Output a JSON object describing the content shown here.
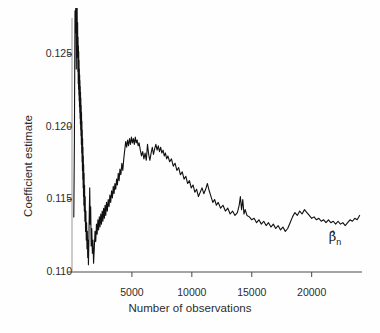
{
  "figure": {
    "background_color": "#fefefe",
    "line_color": "#111111",
    "axis_color": "#4a4a4a"
  },
  "annotations": [
    {
      "name": "beta-hat-n",
      "base": "β̂",
      "sub": "n",
      "x_value": 22000,
      "y_value": 0.1124
    }
  ],
  "chart_data": {
    "type": "line",
    "title": "",
    "xlabel": "Number of observations",
    "ylabel": "Coefficient estimate",
    "xlim": [
      0,
      24200
    ],
    "ylim": [
      0.11,
      0.1282
    ],
    "grid": false,
    "legend": null,
    "xticks": [
      5000,
      10000,
      15000,
      20000
    ],
    "xtick_labels": [
      "5000",
      "10000",
      "15000",
      "20000"
    ],
    "yticks": [
      0.11,
      0.115,
      0.12,
      0.125
    ],
    "ytick_labels": [
      "0.110",
      "0.115",
      "0.120",
      "0.125"
    ],
    "series": [
      {
        "name": "Coefficient estimate β̂n",
        "x": [
          150,
          200,
          250,
          300,
          330,
          360,
          390,
          410,
          430,
          450,
          470,
          490,
          505,
          520,
          535,
          550,
          562,
          575,
          588,
          600,
          612,
          625,
          638,
          650,
          662,
          675,
          688,
          700,
          712,
          725,
          738,
          750,
          765,
          780,
          795,
          810,
          825,
          840,
          855,
          870,
          885,
          900,
          915,
          930,
          945,
          960,
          975,
          990,
          1010,
          1030,
          1050,
          1075,
          1100,
          1130,
          1160,
          1190,
          1220,
          1250,
          1280,
          1310,
          1340,
          1370,
          1400,
          1440,
          1480,
          1520,
          1560,
          1600,
          1650,
          1700,
          1750,
          1800,
          1860,
          1920,
          1980,
          2040,
          2100,
          2160,
          2220,
          2280,
          2340,
          2400,
          2460,
          2520,
          2580,
          2640,
          2700,
          2760,
          2820,
          2880,
          2950,
          3020,
          3090,
          3160,
          3230,
          3300,
          3370,
          3440,
          3510,
          3580,
          3650,
          3720,
          3790,
          3860,
          3930,
          4000,
          4080,
          4160,
          4240,
          4320,
          4400,
          4480,
          4560,
          4640,
          4720,
          4800,
          4880,
          4960,
          5040,
          5120,
          5200,
          5280,
          5360,
          5440,
          5520,
          5600,
          5700,
          5800,
          5900,
          6000,
          6100,
          6200,
          6300,
          6400,
          6500,
          6600,
          6700,
          6800,
          6900,
          7000,
          7100,
          7200,
          7300,
          7400,
          7500,
          7600,
          7700,
          7800,
          7900,
          8000,
          8150,
          8300,
          8450,
          8600,
          8750,
          8900,
          9050,
          9200,
          9350,
          9500,
          9650,
          9800,
          9950,
          10100,
          10250,
          10400,
          10550,
          10700,
          10850,
          11000,
          11150,
          11300,
          11450,
          11600,
          11750,
          11900,
          12050,
          12200,
          12400,
          12600,
          12800,
          13000,
          13200,
          13400,
          13600,
          13800,
          13950,
          14050,
          14150,
          14250,
          14350,
          14450,
          14600,
          14800,
          15000,
          15200,
          15400,
          15600,
          15800,
          16000,
          16200,
          16400,
          16600,
          16800,
          17000,
          17200,
          17400,
          17600,
          17800,
          18000,
          18200,
          18400,
          18600,
          18800,
          19000,
          19200,
          19400,
          19600,
          19800,
          20000,
          20200,
          20400,
          20600,
          20800,
          21000,
          21200,
          21400,
          21600,
          21800,
          22000,
          22200,
          22400,
          22600,
          22800,
          23000,
          23200,
          23400,
          23600,
          23800,
          24000
        ],
        "y": [
          0.1138,
          0.119,
          0.128,
          0.1265,
          0.131,
          0.124,
          0.1295,
          0.1255,
          0.1282,
          0.1248,
          0.1272,
          0.1238,
          0.1262,
          0.123,
          0.1256,
          0.1226,
          0.1252,
          0.1222,
          0.1246,
          0.1218,
          0.124,
          0.1214,
          0.1236,
          0.121,
          0.1232,
          0.1206,
          0.1228,
          0.1202,
          0.1224,
          0.1198,
          0.122,
          0.1194,
          0.1215,
          0.1188,
          0.121,
          0.1182,
          0.1204,
          0.1176,
          0.1198,
          0.117,
          0.1192,
          0.1164,
          0.1186,
          0.1158,
          0.118,
          0.1152,
          0.1174,
          0.1146,
          0.1168,
          0.1142,
          0.116,
          0.1135,
          0.1152,
          0.1128,
          0.1142,
          0.1122,
          0.1134,
          0.1116,
          0.1128,
          0.111,
          0.1122,
          0.1105,
          0.1118,
          0.114,
          0.1158,
          0.1133,
          0.1145,
          0.1118,
          0.113,
          0.1113,
          0.1122,
          0.1106,
          0.1116,
          0.1128,
          0.1121,
          0.1133,
          0.1126,
          0.1136,
          0.1129,
          0.1138,
          0.1131,
          0.114,
          0.1133,
          0.1142,
          0.1135,
          0.1144,
          0.1137,
          0.1146,
          0.1139,
          0.1148,
          0.1142,
          0.115,
          0.1145,
          0.1153,
          0.1148,
          0.1156,
          0.1151,
          0.1159,
          0.1154,
          0.1161,
          0.1157,
          0.1164,
          0.116,
          0.1168,
          0.1163,
          0.1171,
          0.1167,
          0.1175,
          0.117,
          0.1178,
          0.1184,
          0.119,
          0.1186,
          0.1191,
          0.1187,
          0.1192,
          0.1188,
          0.1193,
          0.1189,
          0.1192,
          0.1188,
          0.1193,
          0.1189,
          0.1191,
          0.1187,
          0.1189,
          0.1184,
          0.118,
          0.1183,
          0.1178,
          0.1182,
          0.1177,
          0.1188,
          0.1181,
          0.1177,
          0.1182,
          0.1186,
          0.1181,
          0.1185,
          0.1188,
          0.1184,
          0.1187,
          0.1183,
          0.1186,
          0.1182,
          0.1184,
          0.118,
          0.1182,
          0.1178,
          0.118,
          0.1176,
          0.1178,
          0.1173,
          0.1175,
          0.117,
          0.1172,
          0.1167,
          0.1169,
          0.1164,
          0.1166,
          0.1161,
          0.1163,
          0.1158,
          0.116,
          0.1155,
          0.1157,
          0.1152,
          0.1155,
          0.1158,
          0.1154,
          0.1157,
          0.1161,
          0.1156,
          0.1152,
          0.1148,
          0.115,
          0.1146,
          0.1148,
          0.1144,
          0.1146,
          0.1142,
          0.1144,
          0.114,
          0.1142,
          0.1139,
          0.1141,
          0.1146,
          0.1152,
          0.1143,
          0.115,
          0.114,
          0.1143,
          0.1139,
          0.1138,
          0.1136,
          0.1137,
          0.1134,
          0.1136,
          0.1133,
          0.1135,
          0.1132,
          0.1134,
          0.1131,
          0.1133,
          0.113,
          0.1132,
          0.1129,
          0.1131,
          0.1128,
          0.113,
          0.1134,
          0.1138,
          0.1141,
          0.1139,
          0.1142,
          0.114,
          0.1143,
          0.1141,
          0.1139,
          0.1137,
          0.1138,
          0.1136,
          0.1137,
          0.1135,
          0.1136,
          0.1134,
          0.1136,
          0.1134,
          0.1135,
          0.1133,
          0.1135,
          0.1133,
          0.1134,
          0.1132,
          0.1134,
          0.1136,
          0.1135,
          0.1137,
          0.1136,
          0.1139
        ]
      }
    ]
  }
}
